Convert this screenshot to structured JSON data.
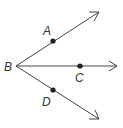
{
  "diagram": {
    "type": "rays-from-vertex",
    "stroke_color": "#444444",
    "vertex": {
      "label": "B",
      "x": 16,
      "y": 66
    },
    "rays": [
      {
        "name": "ray-BA",
        "end": {
          "x": 99,
          "y": 12
        },
        "point": {
          "label": "A",
          "x": 53,
          "y": 41
        }
      },
      {
        "name": "ray-BC",
        "end": {
          "x": 117,
          "y": 66
        },
        "point": {
          "label": "C",
          "x": 80,
          "y": 66
        }
      },
      {
        "name": "ray-BD",
        "end": {
          "x": 99,
          "y": 119
        },
        "point": {
          "label": "D",
          "x": 53,
          "y": 90
        }
      }
    ]
  }
}
